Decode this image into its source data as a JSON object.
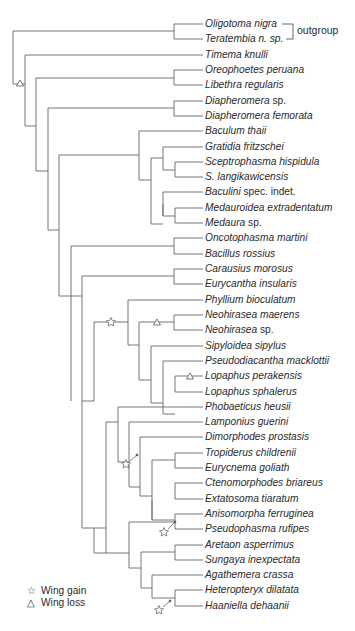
{
  "figure": {
    "type": "cladogram",
    "line_color": "#555555",
    "text_color": "#2a2a2a"
  },
  "outgroup": {
    "label": "outgroup"
  },
  "taxa": [
    {
      "genus": "Oligotoma nigra",
      "rest": "",
      "y": 24
    },
    {
      "genus": "Teratembia n. sp.",
      "rest": "",
      "y": 39
    },
    {
      "genus": "Timema knulli",
      "rest": "",
      "y": 55
    },
    {
      "genus": "Oreophoetes peruana",
      "rest": "",
      "y": 70
    },
    {
      "genus": "Libethra regularis",
      "rest": "",
      "y": 85
    },
    {
      "genus": "Diapheromera",
      "rest": " sp.",
      "y": 101
    },
    {
      "genus": "Diapheromera femorata",
      "rest": "",
      "y": 116
    },
    {
      "genus": "Baculum thaii",
      "rest": "",
      "y": 131
    },
    {
      "genus": "Gratidia fritzschei",
      "rest": "",
      "y": 147
    },
    {
      "genus": "Sceptrophasma hispidula",
      "rest": "",
      "y": 162
    },
    {
      "genus": "S. langikawicensis",
      "rest": "",
      "y": 177
    },
    {
      "genus": "Baculini",
      "rest": " spec. indet.",
      "y": 192
    },
    {
      "genus": "Medauroidea extradentatum",
      "rest": "",
      "y": 208
    },
    {
      "genus": "Medaura",
      "rest": " sp.",
      "y": 223
    },
    {
      "genus": "Oncotophasma martini",
      "rest": "",
      "y": 238
    },
    {
      "genus": "Bacillus rossius",
      "rest": "",
      "y": 254
    },
    {
      "genus": "Carausius morosus",
      "rest": "",
      "y": 269
    },
    {
      "genus": "Eurycantha insularis",
      "rest": "",
      "y": 284
    },
    {
      "genus": "Phyllium bioculatum",
      "rest": "",
      "y": 300
    },
    {
      "genus": "Neohirasea maerens",
      "rest": "",
      "y": 315
    },
    {
      "genus": "Neohirasea",
      "rest": " sp.",
      "y": 330
    },
    {
      "genus": "Sipyloidea sipylus",
      "rest": "",
      "y": 346
    },
    {
      "genus": "Pseudodiacantha macklottii",
      "rest": "",
      "y": 361
    },
    {
      "genus": "Lopaphus perakensis",
      "rest": "",
      "y": 376
    },
    {
      "genus": "Lopaphus sphalerus",
      "rest": "",
      "y": 392
    },
    {
      "genus": "Phobaeticus heusii",
      "rest": "",
      "y": 407
    },
    {
      "genus": "Lamponius guerini",
      "rest": "",
      "y": 422
    },
    {
      "genus": "Dimorphodes prostasis",
      "rest": "",
      "y": 437
    },
    {
      "genus": "Tropiderus childrenii",
      "rest": "",
      "y": 453
    },
    {
      "genus": "Eurycnema goliath",
      "rest": "",
      "y": 468
    },
    {
      "genus": "Ctenomorphodes briareus",
      "rest": "",
      "y": 483
    },
    {
      "genus": "Extatosoma tiaratum",
      "rest": "",
      "y": 499
    },
    {
      "genus": "Anisomorpha ferruginea",
      "rest": "",
      "y": 514
    },
    {
      "genus": "Pseudophasma rufipes",
      "rest": "",
      "y": 529
    },
    {
      "genus": "Aretaon asperrimus",
      "rest": "",
      "y": 545
    },
    {
      "genus": "Sungaya inexpectata",
      "rest": "",
      "y": 560
    },
    {
      "genus": "Agathemera crassa",
      "rest": "",
      "y": 575
    },
    {
      "genus": "Heteropteryx dilatata",
      "rest": "",
      "y": 590
    },
    {
      "genus": "Haaniella dehaanii",
      "rest": "",
      "y": 606
    }
  ],
  "legend": {
    "items": [
      {
        "symbol": "☆",
        "label": "Wing gain"
      },
      {
        "symbol": "△",
        "label": "Wing loss"
      }
    ]
  },
  "markers": [
    {
      "type": "wing-loss",
      "x": 20,
      "y": 84
    },
    {
      "type": "wing-gain",
      "x": 111,
      "y": 322
    },
    {
      "type": "wing-loss",
      "x": 157,
      "y": 323
    },
    {
      "type": "wing-loss",
      "x": 190,
      "y": 377
    },
    {
      "type": "wing-gain-arrow",
      "x": 126,
      "y": 464
    },
    {
      "type": "wing-gain-arrow",
      "x": 164,
      "y": 532
    },
    {
      "type": "wing-gain-arrow",
      "x": 159,
      "y": 610
    }
  ]
}
